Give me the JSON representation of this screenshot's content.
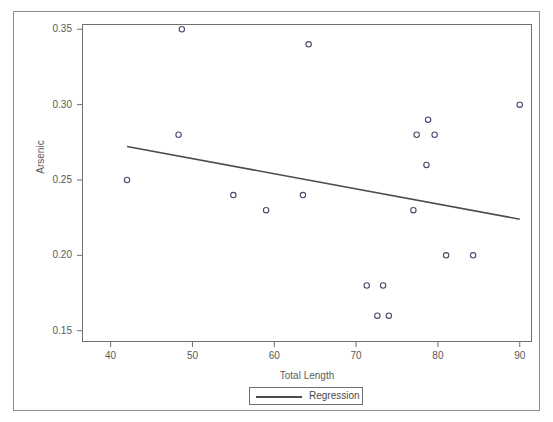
{
  "chart_data": {
    "type": "scatter",
    "title": "",
    "xlabel": "Total Length",
    "ylabel": "Arsenic",
    "xlim": [
      36.5,
      91.5
    ],
    "ylim": [
      0.1425,
      0.3535
    ],
    "grid": false,
    "legend": {
      "position": "bottom-center",
      "entries": [
        {
          "label": "Regression",
          "type": "line",
          "color": "#4c4c4c"
        }
      ]
    },
    "xticks": [
      40,
      50,
      60,
      70,
      80,
      90
    ],
    "xtick_labels": [
      "40",
      "50",
      "60",
      "70",
      "80",
      "90"
    ],
    "yticks": [
      0.15,
      0.2,
      0.25,
      0.3,
      0.35
    ],
    "ytick_labels": [
      "0.15",
      "0.20",
      "0.25",
      "0.30",
      "0.35"
    ],
    "series": [
      {
        "name": "Arsenic vs Total Length",
        "type": "scatter",
        "marker": "open-circle",
        "color": "#4a4a6e",
        "points": [
          {
            "x": 42.0,
            "y": 0.25
          },
          {
            "x": 48.7,
            "y": 0.35
          },
          {
            "x": 48.3,
            "y": 0.28
          },
          {
            "x": 55.0,
            "y": 0.24
          },
          {
            "x": 59.0,
            "y": 0.23
          },
          {
            "x": 63.5,
            "y": 0.24
          },
          {
            "x": 64.2,
            "y": 0.34
          },
          {
            "x": 71.3,
            "y": 0.18
          },
          {
            "x": 72.6,
            "y": 0.16
          },
          {
            "x": 73.3,
            "y": 0.18
          },
          {
            "x": 74.0,
            "y": 0.16
          },
          {
            "x": 77.0,
            "y": 0.23
          },
          {
            "x": 77.4,
            "y": 0.28
          },
          {
            "x": 78.6,
            "y": 0.26
          },
          {
            "x": 78.8,
            "y": 0.29
          },
          {
            "x": 79.6,
            "y": 0.28
          },
          {
            "x": 81.0,
            "y": 0.2
          },
          {
            "x": 84.3,
            "y": 0.2
          },
          {
            "x": 90.0,
            "y": 0.3
          }
        ]
      },
      {
        "name": "Regression",
        "type": "line",
        "color": "#4c4c4c",
        "endpoints": [
          {
            "x": 42.0,
            "y": 0.2722
          },
          {
            "x": 90.0,
            "y": 0.224
          }
        ]
      }
    ]
  }
}
